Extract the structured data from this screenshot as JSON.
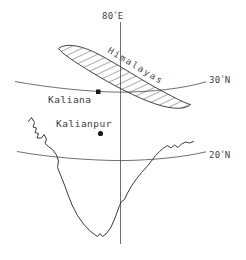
{
  "figure": {
    "width": 246,
    "height": 260,
    "background_color": "#ffffff",
    "line_color": "#3a3a3a",
    "label_color": "#444444"
  },
  "graticule": {
    "meridian": {
      "label_value": "80",
      "label_degree": "°",
      "label_hemisphere": "E",
      "label_full": "80°E"
    },
    "parallels": [
      {
        "label_value": "30",
        "label_degree": "°",
        "label_hemisphere": "N",
        "label_full": "30°N"
      },
      {
        "label_value": "20",
        "label_degree": "°",
        "label_hemisphere": "N",
        "label_full": "20°N"
      }
    ]
  },
  "features": {
    "mountain_range": {
      "label": "Himalayas",
      "pattern": "diagonal-hatch",
      "outline_color": "#2e2e2e"
    },
    "stations": [
      {
        "label": "Kaliana",
        "marker": "square",
        "marker_color": "#1a1a1a"
      },
      {
        "label": "Kalianpur",
        "marker": "circle",
        "marker_color": "#1a1a1a"
      }
    ],
    "coastline": {
      "name": "india-coastline",
      "color": "#3a3a3a"
    }
  }
}
